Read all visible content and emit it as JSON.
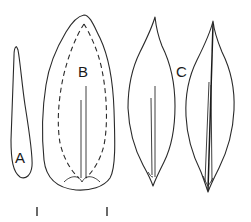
{
  "figure": {
    "type": "botanical line drawing",
    "labels": {
      "a": "A",
      "b": "B",
      "c": "C"
    },
    "elements": [
      {
        "id": "leaf-a",
        "label": "A",
        "shape": "narrow linear-oblanceolate"
      },
      {
        "id": "leaf-b",
        "label": "B",
        "shape": "broad obovate with dashed inner outline"
      },
      {
        "id": "leaf-c-left",
        "label": "C",
        "shape": "lanceolate, acuminate tip"
      },
      {
        "id": "leaf-c-right",
        "label": "C",
        "shape": "lanceolate, acuminate tip, with thick midrib"
      }
    ],
    "scale_bar": {
      "ticks": 2,
      "text": ""
    }
  }
}
